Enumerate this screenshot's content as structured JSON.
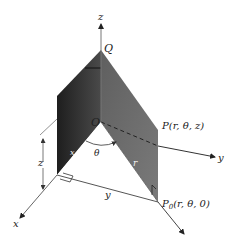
{
  "figure": {
    "type": "cylindrical-coordinates-diagram",
    "colors": {
      "background": "#ffffff",
      "dark_plane": "#3a3a3a",
      "gray_plane": "#6e6e6e",
      "axis": "#555555",
      "text": "#222222"
    },
    "axes": {
      "z_label": "z",
      "x_label": "x",
      "y_label": "y"
    },
    "points": {
      "origin_label": "O",
      "Q_label": "Q",
      "P_label": "P(r,  θ,  z)",
      "P0_label_main": "P",
      "P0_label_sub": "0",
      "P0_label_rest": "(r,  θ,  0)"
    },
    "measures": {
      "theta_label": "θ",
      "r_label": "r",
      "z_dim_label": "z",
      "y_dim_label": "y",
      "x_dim_label": "x"
    }
  }
}
